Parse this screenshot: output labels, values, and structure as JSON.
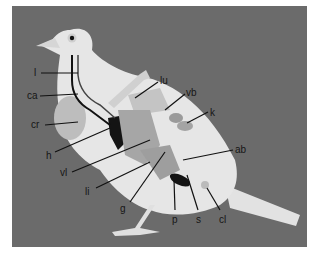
{
  "figure": {
    "colors": {
      "background": "#6b6b6b",
      "body": "#e8e8e8",
      "organ_light": "#bdbdbd",
      "organ_mid": "#9a9a9a",
      "organ_dark": "#141414",
      "leader": "#111111"
    },
    "labels": [
      {
        "id": "l",
        "text": "l",
        "x": 34,
        "y": 68
      },
      {
        "id": "ca",
        "text": "ca",
        "x": 27,
        "y": 91
      },
      {
        "id": "cr",
        "text": "cr",
        "x": 31,
        "y": 120
      },
      {
        "id": "h",
        "text": "h",
        "x": 46,
        "y": 151
      },
      {
        "id": "vl",
        "text": "vl",
        "x": 60,
        "y": 172
      },
      {
        "id": "li",
        "text": "li",
        "x": 85,
        "y": 187
      },
      {
        "id": "g",
        "text": "g",
        "x": 120,
        "y": 207
      },
      {
        "id": "p",
        "text": "p",
        "x": 172,
        "y": 219
      },
      {
        "id": "s",
        "text": "s",
        "x": 196,
        "y": 219
      },
      {
        "id": "cl",
        "text": "cl",
        "x": 219,
        "y": 219
      },
      {
        "id": "lu",
        "text": "lu",
        "x": 160,
        "y": 79
      },
      {
        "id": "vb",
        "text": "vb",
        "x": 186,
        "y": 89
      },
      {
        "id": "k",
        "text": "k",
        "x": 210,
        "y": 108
      },
      {
        "id": "ab",
        "text": "ab",
        "x": 235,
        "y": 146
      }
    ]
  }
}
